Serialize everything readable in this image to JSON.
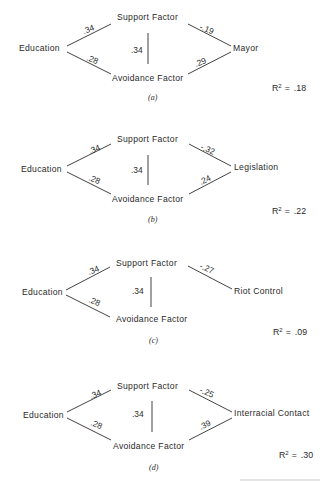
{
  "figure": {
    "common": {
      "source": "Education",
      "mediator_top": "Support Factor",
      "mediator_bottom": "Avoidance Factor",
      "r2_prefix": "R",
      "r2_sup": "2",
      "r2_eq": "="
    },
    "panels": [
      {
        "caption": "(a)",
        "outcome": "Mayor",
        "paths": {
          "edu_support": ".34",
          "edu_avoid": ".28",
          "support_avoid": ".34",
          "support_outcome": "-.19",
          "avoid_outcome": ".29"
        },
        "r2": ".18"
      },
      {
        "caption": "(b)",
        "outcome": "Legislation",
        "paths": {
          "edu_support": ".34",
          "edu_avoid": ".28",
          "support_avoid": ".34",
          "support_outcome": "-.32",
          "avoid_outcome": ".24"
        },
        "r2": ".22"
      },
      {
        "caption": "(c)",
        "outcome": "Riot Control",
        "paths": {
          "edu_support": ".34",
          "edu_avoid": ".28",
          "support_avoid": ".34",
          "support_outcome": "-.27"
        },
        "r2": ".09"
      },
      {
        "caption": "(d)",
        "outcome": "Interracial Contact",
        "paths": {
          "edu_support": ".34",
          "edu_avoid": ".28",
          "support_avoid": ".34",
          "support_outcome": "-.25",
          "avoid_outcome": ".39"
        },
        "r2": ".30"
      }
    ]
  }
}
